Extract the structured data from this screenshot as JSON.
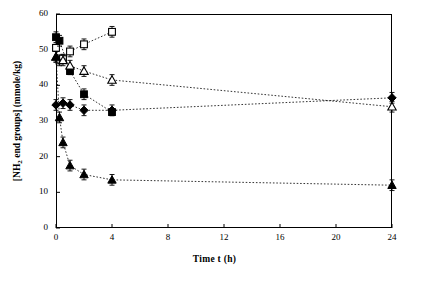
{
  "chart_data": {
    "type": "scatter",
    "title": "",
    "xlabel": "Time t (h)",
    "ylabel": "[NH2 end groups] (mmole/kg)",
    "ylabel_prefix": "[NH",
    "ylabel_sub": "2",
    "ylabel_suffix": " end groups] (mmole/kg)",
    "xlim": [
      0,
      24
    ],
    "ylim": [
      0,
      60
    ],
    "xticks": [
      0,
      4,
      8,
      12,
      16,
      20,
      24
    ],
    "xticklabels": [
      "0",
      "4",
      "8",
      "12",
      "16",
      "20",
      "24"
    ],
    "yticks": [
      0,
      10,
      20,
      30,
      40,
      50,
      60
    ],
    "yticklabels": [
      "0",
      "10",
      "20",
      "30",
      "40",
      "50",
      "60"
    ],
    "grid": false,
    "legend": "none",
    "series": [
      {
        "name": "open-square",
        "marker": "open-square",
        "line": "dotted",
        "points": [
          {
            "x": 0.0,
            "y": 50.5,
            "err": 1.0
          },
          {
            "x": 0.25,
            "y": 47.0,
            "err": 1.5
          },
          {
            "x": 0.5,
            "y": 47.5,
            "err": 1.2
          },
          {
            "x": 1.0,
            "y": 49.5,
            "err": 1.5
          },
          {
            "x": 2.0,
            "y": 51.5,
            "err": 1.5
          },
          {
            "x": 4.0,
            "y": 55.0,
            "err": 1.5
          }
        ]
      },
      {
        "name": "filled-square",
        "marker": "filled-square",
        "line": "dotted",
        "points": [
          {
            "x": 0.0,
            "y": 53.5,
            "err": 1.5
          },
          {
            "x": 0.25,
            "y": 52.5,
            "err": 1.5
          },
          {
            "x": 1.0,
            "y": 44.0,
            "err": 1.0
          },
          {
            "x": 2.0,
            "y": 37.5,
            "err": 1.5
          },
          {
            "x": 4.0,
            "y": 32.5,
            "err": 1.0
          }
        ]
      },
      {
        "name": "open-triangle",
        "marker": "open-triangle",
        "line": "dotted",
        "points": [
          {
            "x": 0.0,
            "y": 48.0,
            "err": 1.5
          },
          {
            "x": 0.5,
            "y": 47.0,
            "err": 1.5
          },
          {
            "x": 1.0,
            "y": 45.5,
            "err": 1.5
          },
          {
            "x": 2.0,
            "y": 44.0,
            "err": 1.5
          },
          {
            "x": 4.0,
            "y": 41.5,
            "err": 1.5
          },
          {
            "x": 24.0,
            "y": 34.0,
            "err": 1.5
          }
        ]
      },
      {
        "name": "filled-diamond",
        "marker": "filled-diamond",
        "line": "dotted",
        "points": [
          {
            "x": 0.0,
            "y": 34.5,
            "err": 1.5
          },
          {
            "x": 0.5,
            "y": 35.0,
            "err": 1.5
          },
          {
            "x": 1.0,
            "y": 34.5,
            "err": 1.5
          },
          {
            "x": 2.0,
            "y": 33.0,
            "err": 1.5
          },
          {
            "x": 4.0,
            "y": 33.0,
            "err": 1.5
          },
          {
            "x": 24.0,
            "y": 36.5,
            "err": 1.5
          }
        ]
      },
      {
        "name": "filled-triangle",
        "marker": "filled-triangle",
        "line": "dotted",
        "points": [
          {
            "x": 0.0,
            "y": 48.0,
            "err": 1.5
          },
          {
            "x": 0.25,
            "y": 31.0,
            "err": 1.5
          },
          {
            "x": 0.5,
            "y": 24.0,
            "err": 1.5
          },
          {
            "x": 1.0,
            "y": 17.5,
            "err": 1.5
          },
          {
            "x": 2.0,
            "y": 15.0,
            "err": 1.5
          },
          {
            "x": 4.0,
            "y": 13.5,
            "err": 1.5
          },
          {
            "x": 24.0,
            "y": 12.0,
            "err": 1.5
          }
        ]
      }
    ]
  }
}
